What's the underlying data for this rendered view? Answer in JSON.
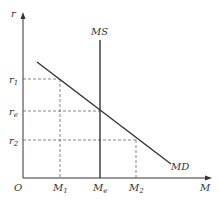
{
  "diagram": {
    "type": "money-market",
    "axis_y_label": "r",
    "axis_x_label": "M",
    "origin_label": "O",
    "supply_label": "MS",
    "demand_label": "MD",
    "y_ticks": [
      {
        "main": "r",
        "sub": "1"
      },
      {
        "main": "r",
        "sub": "e"
      },
      {
        "main": "r",
        "sub": "2"
      }
    ],
    "x_ticks": [
      {
        "main": "M",
        "sub": "1"
      },
      {
        "main": "M",
        "sub": "e"
      },
      {
        "main": "M",
        "sub": "2"
      }
    ],
    "colors": {
      "line": "#333333",
      "dash": "#666666"
    }
  }
}
